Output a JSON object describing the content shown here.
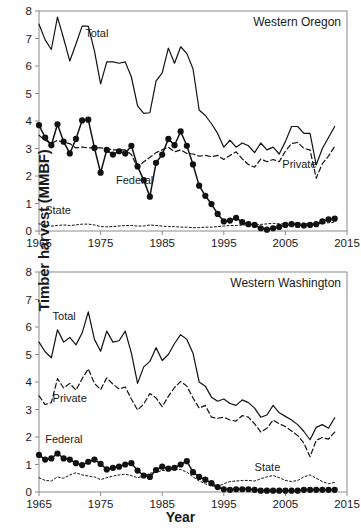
{
  "figure": {
    "y_axis_title": "Timber harvest (MMBF)",
    "x_axis_title": "Year"
  },
  "panels": [
    {
      "id": "western-oregon",
      "title": "Western Oregon",
      "series_labels": {
        "total": "Total",
        "federal": "Federal",
        "private": "Private",
        "state": "State"
      }
    },
    {
      "id": "western-washington",
      "title": "Western Washington",
      "series_labels": {
        "total": "Total",
        "federal": "Federal",
        "private": "Private",
        "state": "State"
      }
    }
  ],
  "axes": {
    "x_ticks": [
      "1965",
      "1975",
      "1985",
      "1995",
      "2005",
      "2015"
    ],
    "y_ticks": [
      "0",
      "1",
      "2",
      "3",
      "4",
      "5",
      "6",
      "7",
      "8"
    ],
    "xlim": [
      1965,
      2015
    ],
    "ylim": [
      0,
      8
    ]
  },
  "chart_data": [
    {
      "type": "line",
      "title": "Western Oregon",
      "xlabel": "Year",
      "ylabel": "Timber harvest (MMBF)",
      "xlim": [
        1965,
        2015
      ],
      "ylim": [
        0,
        8
      ],
      "grid": false,
      "legend": "inline-annotations",
      "x": [
        1965,
        1966,
        1967,
        1968,
        1969,
        1970,
        1971,
        1972,
        1973,
        1974,
        1975,
        1976,
        1977,
        1978,
        1979,
        1980,
        1981,
        1982,
        1983,
        1984,
        1985,
        1986,
        1987,
        1988,
        1989,
        1990,
        1991,
        1992,
        1993,
        1994,
        1995,
        1996,
        1997,
        1998,
        1999,
        2000,
        2001,
        2002,
        2003,
        2004,
        2005,
        2006,
        2007,
        2008,
        2009,
        2010,
        2011,
        2012,
        2013
      ],
      "series": [
        {
          "name": "Total",
          "style": "solid",
          "markers": false,
          "values": [
            7.52,
            6.95,
            6.6,
            7.78,
            7.0,
            6.18,
            6.8,
            7.45,
            7.45,
            6.55,
            5.35,
            6.15,
            6.15,
            6.1,
            6.15,
            5.6,
            4.55,
            4.28,
            4.3,
            5.45,
            5.75,
            6.65,
            6.1,
            6.7,
            6.45,
            5.9,
            4.4,
            4.2,
            3.9,
            3.55,
            3.05,
            3.3,
            3.05,
            3.2,
            3.1,
            2.85,
            3.2,
            2.95,
            3.05,
            2.8,
            3.25,
            3.8,
            3.8,
            3.55,
            3.55,
            2.4,
            3.0,
            3.4,
            3.8
          ]
        },
        {
          "name": "Federal",
          "style": "solid",
          "markers": true,
          "values": [
            3.85,
            3.4,
            3.12,
            3.88,
            3.25,
            2.82,
            3.35,
            4.02,
            4.05,
            3.02,
            2.12,
            2.95,
            2.78,
            2.9,
            2.82,
            3.1,
            2.35,
            1.85,
            1.25,
            2.48,
            2.78,
            3.35,
            3.12,
            3.62,
            3.1,
            2.42,
            1.65,
            1.28,
            0.98,
            0.62,
            0.35,
            0.38,
            0.48,
            0.32,
            0.25,
            0.22,
            0.1,
            0.05,
            0.1,
            0.15,
            0.22,
            0.25,
            0.22,
            0.2,
            0.22,
            0.25,
            0.35,
            0.42,
            0.45
          ]
        },
        {
          "name": "Private",
          "style": "dashed",
          "markers": false,
          "values": [
            3.48,
            3.3,
            3.18,
            3.3,
            3.22,
            3.18,
            3.02,
            3.05,
            3.02,
            3.02,
            3.02,
            3.0,
            2.95,
            2.95,
            2.95,
            2.78,
            2.3,
            2.52,
            2.68,
            2.85,
            2.95,
            3.05,
            2.88,
            2.95,
            2.82,
            2.8,
            2.72,
            2.75,
            2.7,
            2.75,
            2.6,
            2.75,
            2.88,
            2.62,
            2.42,
            2.32,
            2.62,
            2.52,
            2.6,
            2.52,
            2.9,
            3.18,
            3.22,
            3.0,
            2.95,
            1.92,
            2.45,
            2.72,
            3.08
          ]
        },
        {
          "name": "State",
          "style": "dotted",
          "markers": false,
          "values": [
            0.26,
            0.22,
            0.18,
            0.2,
            0.22,
            0.2,
            0.22,
            0.25,
            0.25,
            0.22,
            0.16,
            0.15,
            0.16,
            0.18,
            0.2,
            0.2,
            0.18,
            0.18,
            0.22,
            0.2,
            0.18,
            0.16,
            0.16,
            0.14,
            0.14,
            0.12,
            0.12,
            0.14,
            0.14,
            0.16,
            0.18,
            0.2,
            0.2,
            0.22,
            0.22,
            0.22,
            0.24,
            0.26,
            0.28,
            0.26,
            0.26,
            0.28,
            0.28,
            0.28,
            0.26,
            0.26,
            0.28,
            0.3,
            0.32
          ]
        }
      ]
    },
    {
      "type": "line",
      "title": "Western Washington",
      "xlabel": "Year",
      "ylabel": "Timber harvest (MMBF)",
      "xlim": [
        1965,
        2015
      ],
      "ylim": [
        0,
        8
      ],
      "grid": false,
      "legend": "inline-annotations",
      "x": [
        1965,
        1966,
        1967,
        1968,
        1969,
        1970,
        1971,
        1972,
        1973,
        1974,
        1975,
        1976,
        1977,
        1978,
        1979,
        1980,
        1981,
        1982,
        1983,
        1984,
        1985,
        1986,
        1987,
        1988,
        1989,
        1990,
        1991,
        1992,
        1993,
        1994,
        1995,
        1996,
        1997,
        1998,
        1999,
        2000,
        2001,
        2002,
        2003,
        2004,
        2005,
        2006,
        2007,
        2008,
        2009,
        2010,
        2011,
        2012,
        2013
      ],
      "series": [
        {
          "name": "Total",
          "style": "solid",
          "markers": false,
          "values": [
            5.45,
            5.1,
            4.88,
            5.9,
            5.45,
            5.62,
            5.35,
            5.78,
            6.55,
            5.55,
            5.12,
            5.85,
            5.45,
            5.5,
            5.85,
            5.05,
            3.95,
            4.55,
            4.75,
            5.25,
            4.78,
            5.0,
            5.4,
            5.72,
            5.55,
            5.05,
            4.0,
            3.85,
            3.45,
            3.3,
            3.38,
            3.22,
            3.15,
            3.35,
            3.25,
            3.05,
            2.72,
            2.8,
            3.15,
            2.88,
            2.75,
            2.62,
            2.45,
            2.2,
            1.9,
            2.35,
            2.45,
            2.32,
            2.7
          ]
        },
        {
          "name": "Private",
          "style": "dashed",
          "markers": false,
          "values": [
            3.5,
            3.18,
            3.25,
            4.12,
            3.78,
            3.95,
            3.7,
            4.12,
            4.48,
            3.95,
            3.72,
            4.15,
            3.92,
            3.75,
            3.82,
            3.38,
            2.98,
            3.2,
            3.58,
            3.42,
            3.1,
            3.48,
            3.8,
            4.02,
            3.85,
            3.42,
            3.05,
            3.15,
            2.72,
            2.68,
            2.72,
            2.62,
            2.58,
            2.78,
            2.72,
            2.48,
            2.18,
            2.32,
            2.62,
            2.48,
            2.38,
            2.22,
            2.05,
            1.78,
            1.28,
            1.88,
            1.98,
            1.92,
            2.18
          ]
        },
        {
          "name": "Federal",
          "style": "solid",
          "markers": true,
          "values": [
            1.35,
            1.18,
            1.22,
            1.4,
            1.22,
            1.18,
            1.05,
            0.98,
            1.1,
            1.18,
            1.02,
            0.82,
            0.88,
            0.92,
            1.0,
            1.05,
            0.78,
            0.6,
            0.55,
            0.8,
            0.92,
            0.85,
            0.88,
            1.0,
            1.12,
            0.72,
            0.55,
            0.45,
            0.32,
            0.18,
            0.1,
            0.08,
            0.1,
            0.1,
            0.1,
            0.08,
            0.05,
            0.05,
            0.05,
            0.05,
            0.05,
            0.05,
            0.05,
            0.08,
            0.08,
            0.08,
            0.08,
            0.08,
            0.08
          ]
        },
        {
          "name": "State",
          "style": "dotted",
          "markers": false,
          "values": [
            0.52,
            0.42,
            0.4,
            0.55,
            0.5,
            0.62,
            0.7,
            0.62,
            0.58,
            0.55,
            0.45,
            0.52,
            0.58,
            0.62,
            0.65,
            0.6,
            0.52,
            0.58,
            0.68,
            0.72,
            0.78,
            0.8,
            0.82,
            0.82,
            0.72,
            0.55,
            0.4,
            0.3,
            0.22,
            0.2,
            0.3,
            0.38,
            0.4,
            0.42,
            0.42,
            0.4,
            0.48,
            0.55,
            0.6,
            0.52,
            0.42,
            0.38,
            0.42,
            0.55,
            0.62,
            0.5,
            0.38,
            0.3,
            0.35
          ]
        }
      ]
    }
  ]
}
